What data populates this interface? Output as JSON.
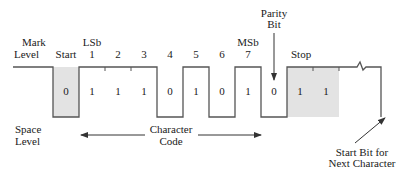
{
  "labels": {
    "mark_level_1": "Mark",
    "mark_level_2": "Level",
    "start": "Start",
    "lsb": "LSb",
    "msb": "MSb",
    "parity_1": "Parity",
    "parity_2": "Bit",
    "stop": "Stop",
    "space_level_1": "Space",
    "space_level_2": "Level",
    "char_code_1": "Character",
    "char_code_2": "Code",
    "next_start_1": "Start Bit for",
    "next_start_2": "Next Character"
  },
  "bit_positions": [
    "1",
    "2",
    "3",
    "4",
    "5",
    "6",
    "7"
  ],
  "bit_values": {
    "start": "0",
    "data": [
      "1",
      "1",
      "1",
      "0",
      "1",
      "0",
      "1"
    ],
    "parity": "0",
    "stop": [
      "1",
      "1"
    ]
  },
  "colors": {
    "line": "#555555",
    "shade": "#e3e3e3",
    "text": "#1a1a1a"
  }
}
